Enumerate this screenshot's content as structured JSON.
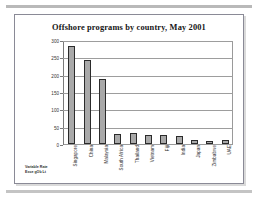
{
  "slide": {
    "source_note_line1": "Variable Rate",
    "source_note_line2": "Exce gOb Lt"
  },
  "chart_data": {
    "type": "bar",
    "title": "Offshore programs by country, May 2001",
    "xlabel": "",
    "ylabel": "",
    "ylim": [
      0,
      300
    ],
    "ytick_step": 50,
    "yticks": [
      0,
      50,
      100,
      150,
      200,
      250,
      300
    ],
    "ytick_labels": [
      "0",
      "50",
      "100",
      "150",
      "200",
      "250",
      "300"
    ],
    "grid": true,
    "legend": false,
    "bar_color": "#a9a9a9",
    "bar_border_color": "#2b2b2b",
    "categories": [
      "Singapore",
      "China",
      "Malaysia",
      "South Africa",
      "Thailand",
      "Vietnam",
      "Fiji",
      "India",
      "Japan",
      "Zimbabwe",
      "UAE"
    ],
    "values": [
      285,
      245,
      190,
      30,
      32,
      27,
      27,
      22,
      12,
      10,
      11
    ]
  }
}
